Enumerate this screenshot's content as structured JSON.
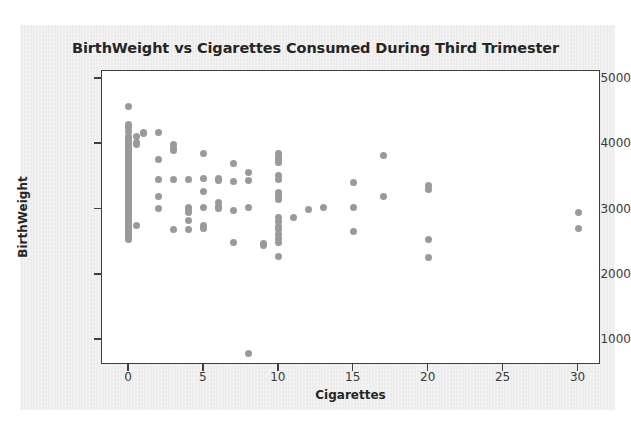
{
  "chart_data": {
    "type": "scatter",
    "title": "BirthWeight vs Cigarettes Consumed During Third Trimester",
    "xlabel": "Cigarettes",
    "ylabel": "BirthWeight",
    "xlim": [
      -1.8,
      31.5
    ],
    "ylim": [
      620,
      5120
    ],
    "xticks": [
      0,
      5,
      10,
      15,
      20,
      25,
      30
    ],
    "yticks": [
      1000,
      2000,
      3000,
      4000,
      5000
    ],
    "xtick_labels": [
      "0",
      "5",
      "10",
      "15",
      "20",
      "25",
      "30"
    ],
    "ytick_labels": [
      "1000",
      "2000",
      "3000",
      "4000",
      "5000"
    ],
    "grid": false,
    "legend": null,
    "marker_color": "#9a9a9a",
    "marker_size": 7,
    "frame_color": "#3f3f3f",
    "figure_background": "#ececec",
    "axes_background": "#ffffff",
    "series": [
      {
        "name": "observations",
        "points": [
          [
            0,
            4570
          ],
          [
            0,
            4300
          ],
          [
            0,
            4250
          ],
          [
            0,
            4190
          ],
          [
            0,
            4120
          ],
          [
            0,
            4090
          ],
          [
            0,
            4060
          ],
          [
            0,
            4030
          ],
          [
            0,
            4000
          ],
          [
            0,
            3970
          ],
          [
            0,
            3940
          ],
          [
            0,
            3910
          ],
          [
            0,
            3880
          ],
          [
            0,
            3850
          ],
          [
            0,
            3820
          ],
          [
            0,
            3790
          ],
          [
            0,
            3760
          ],
          [
            0,
            3730
          ],
          [
            0,
            3700
          ],
          [
            0,
            3670
          ],
          [
            0,
            3640
          ],
          [
            0,
            3610
          ],
          [
            0,
            3580
          ],
          [
            0,
            3550
          ],
          [
            0,
            3520
          ],
          [
            0,
            3490
          ],
          [
            0,
            3460
          ],
          [
            0,
            3430
          ],
          [
            0,
            3400
          ],
          [
            0,
            3370
          ],
          [
            0,
            3340
          ],
          [
            0,
            3310
          ],
          [
            0,
            3280
          ],
          [
            0,
            3250
          ],
          [
            0,
            3220
          ],
          [
            0,
            3190
          ],
          [
            0,
            3160
          ],
          [
            0,
            3130
          ],
          [
            0,
            3100
          ],
          [
            0,
            3070
          ],
          [
            0,
            3040
          ],
          [
            0,
            3010
          ],
          [
            0,
            2980
          ],
          [
            0,
            2950
          ],
          [
            0,
            2920
          ],
          [
            0,
            2890
          ],
          [
            0,
            2860
          ],
          [
            0,
            2830
          ],
          [
            0,
            2800
          ],
          [
            0,
            2770
          ],
          [
            0,
            2740
          ],
          [
            0,
            2710
          ],
          [
            0,
            2680
          ],
          [
            0,
            2650
          ],
          [
            0,
            2620
          ],
          [
            0,
            2590
          ],
          [
            0,
            2560
          ],
          [
            0,
            2540
          ],
          [
            0.5,
            4110
          ],
          [
            0.5,
            4030
          ],
          [
            0.5,
            3990
          ],
          [
            0.5,
            2760
          ],
          [
            1,
            4180
          ],
          [
            1,
            4160
          ],
          [
            2,
            4180
          ],
          [
            2,
            3760
          ],
          [
            2,
            3460
          ],
          [
            2,
            3200
          ],
          [
            2,
            3010
          ],
          [
            3,
            3990
          ],
          [
            3,
            3940
          ],
          [
            3,
            3900
          ],
          [
            3,
            3460
          ],
          [
            3,
            2690
          ],
          [
            4,
            3460
          ],
          [
            4,
            3030
          ],
          [
            4,
            3000
          ],
          [
            4,
            2960
          ],
          [
            4,
            2830
          ],
          [
            4,
            2690
          ],
          [
            5,
            3860
          ],
          [
            5,
            3470
          ],
          [
            5,
            3280
          ],
          [
            5,
            3030
          ],
          [
            5,
            2750
          ],
          [
            5,
            2710
          ],
          [
            6,
            3470
          ],
          [
            6,
            3450
          ],
          [
            6,
            3100
          ],
          [
            6,
            3040
          ],
          [
            6,
            3010
          ],
          [
            7,
            3700
          ],
          [
            7,
            3430
          ],
          [
            7,
            2980
          ],
          [
            7,
            2500
          ],
          [
            8,
            3560
          ],
          [
            8,
            3440
          ],
          [
            8,
            3030
          ],
          [
            8,
            790
          ],
          [
            9,
            2480
          ],
          [
            9,
            2450
          ],
          [
            10,
            3850
          ],
          [
            10,
            3800
          ],
          [
            10,
            3760
          ],
          [
            10,
            3720
          ],
          [
            10,
            3520
          ],
          [
            10,
            3460
          ],
          [
            10,
            3260
          ],
          [
            10,
            3210
          ],
          [
            10,
            3150
          ],
          [
            10,
            2880
          ],
          [
            10,
            2810
          ],
          [
            10,
            2740
          ],
          [
            10,
            2690
          ],
          [
            10,
            2620
          ],
          [
            10,
            2560
          ],
          [
            10,
            2500
          ],
          [
            10,
            2280
          ],
          [
            11,
            2880
          ],
          [
            12,
            3000
          ],
          [
            13,
            3030
          ],
          [
            15,
            3410
          ],
          [
            15,
            3030
          ],
          [
            15,
            2670
          ],
          [
            17,
            3830
          ],
          [
            17,
            3200
          ],
          [
            20,
            3360
          ],
          [
            20,
            3300
          ],
          [
            20,
            2540
          ],
          [
            20,
            2260
          ],
          [
            30,
            2960
          ],
          [
            30,
            2710
          ]
        ]
      }
    ]
  }
}
